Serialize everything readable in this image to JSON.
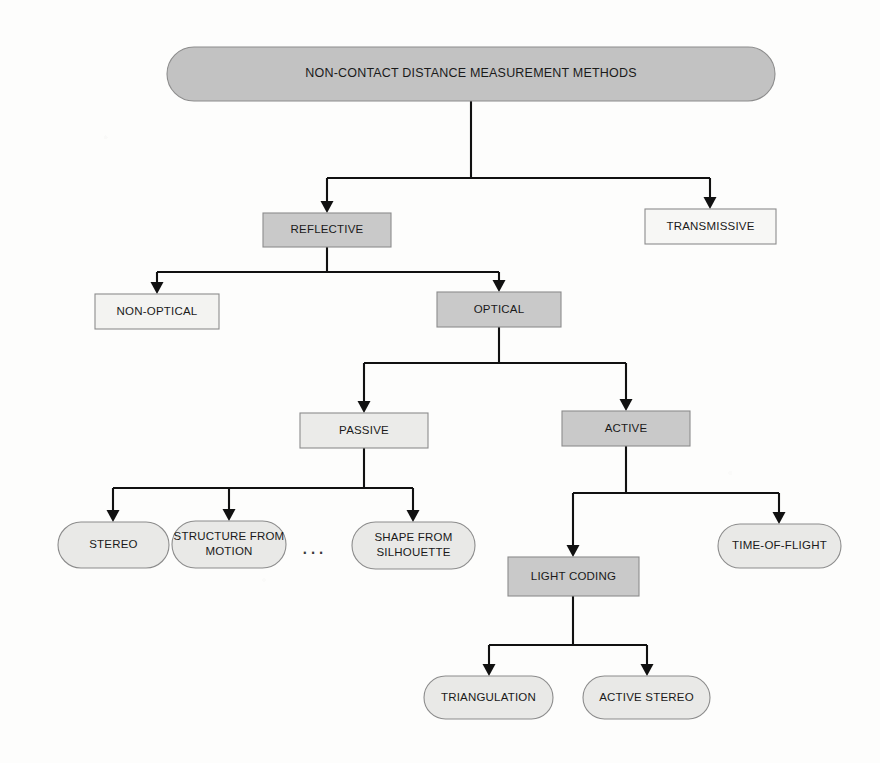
{
  "diagram": {
    "title": "NON-CONTACT DISTANCE MEASUREMENT METHODS",
    "type": "tree-taxonomy",
    "orientation": "top-down",
    "background_color": "#fdfdfc",
    "edge_color": "#111111",
    "palette": {
      "fill_dark": "#c9c9c9",
      "fill_light": "#ededed",
      "fill_white": "#f7f7f5",
      "stroke": "#8c8c8c",
      "text": "#1a1a1a"
    },
    "ellipsis": {
      "label": "...",
      "x": 314,
      "y": 548
    },
    "nodes": [
      {
        "id": "root",
        "label": "NON-CONTACT DISTANCE MEASUREMENT METHODS",
        "shape": "pill",
        "fill": "#c2c2c2",
        "stroke": "#8c8c8c",
        "x": 167,
        "y": 47,
        "w": 608,
        "h": 54,
        "font_size": 12.5,
        "lines": [
          "NON-CONTACT DISTANCE MEASUREMENT METHODS"
        ],
        "level": 0
      },
      {
        "id": "reflective",
        "label": "REFLECTIVE",
        "shape": "rect",
        "fill": "#c9c9c9",
        "stroke": "#8c8c8c",
        "x": 263,
        "y": 213,
        "w": 128,
        "h": 34,
        "font_size": 11.5,
        "lines": [
          "REFLECTIVE"
        ],
        "level": 1
      },
      {
        "id": "transmissive",
        "label": "TRANSMISSIVE",
        "shape": "rect",
        "fill": "#f7f7f5",
        "stroke": "#8c8c8c",
        "x": 645,
        "y": 209,
        "w": 131,
        "h": 35,
        "font_size": 11.5,
        "lines": [
          "TRANSMISSIVE"
        ],
        "level": 1
      },
      {
        "id": "non-optical",
        "label": "NON-OPTICAL",
        "shape": "rect",
        "fill": "#f3f3f1",
        "stroke": "#8c8c8c",
        "x": 95,
        "y": 294,
        "w": 124,
        "h": 35,
        "font_size": 11.5,
        "lines": [
          "NON-OPTICAL"
        ],
        "level": 2
      },
      {
        "id": "optical",
        "label": "OPTICAL",
        "shape": "rect",
        "fill": "#c9c9c9",
        "stroke": "#8c8c8c",
        "x": 437,
        "y": 292,
        "w": 124,
        "h": 35,
        "font_size": 11.5,
        "lines": [
          "OPTICAL"
        ],
        "level": 2
      },
      {
        "id": "passive",
        "label": "PASSIVE",
        "shape": "rect",
        "fill": "#ebebe9",
        "stroke": "#8c8c8c",
        "x": 300,
        "y": 413,
        "w": 128,
        "h": 35,
        "font_size": 11.5,
        "lines": [
          "PASSIVE"
        ],
        "level": 3
      },
      {
        "id": "active",
        "label": "ACTIVE",
        "shape": "rect",
        "fill": "#c9c9c9",
        "stroke": "#8c8c8c",
        "x": 562,
        "y": 411,
        "w": 128,
        "h": 35,
        "font_size": 11.5,
        "lines": [
          "ACTIVE"
        ],
        "level": 3
      },
      {
        "id": "stereo",
        "label": "STEREO",
        "shape": "pill",
        "fill": "#e9e9e7",
        "stroke": "#8c8c8c",
        "x": 58,
        "y": 522,
        "w": 111,
        "h": 46,
        "font_size": 11.5,
        "lines": [
          "STEREO"
        ],
        "level": 4
      },
      {
        "id": "structure-from-motion",
        "label": "STRUCTURE FROM MOTION",
        "shape": "pill",
        "fill": "#e9e9e7",
        "stroke": "#8c8c8c",
        "x": 172,
        "y": 521,
        "w": 114,
        "h": 47,
        "font_size": 11.5,
        "lines": [
          "STRUCTURE FROM",
          "MOTION"
        ],
        "level": 4
      },
      {
        "id": "shape-from-silhouette",
        "label": "SHAPE FROM SILHOUETTE",
        "shape": "pill",
        "fill": "#e9e9e7",
        "stroke": "#8c8c8c",
        "x": 352,
        "y": 522,
        "w": 123,
        "h": 47,
        "font_size": 11.5,
        "lines": [
          "SHAPE FROM",
          "SILHOUETTE"
        ],
        "level": 4
      },
      {
        "id": "light-coding",
        "label": "LIGHT CODING",
        "shape": "rect",
        "fill": "#c9c9c9",
        "stroke": "#8c8c8c",
        "x": 508,
        "y": 557,
        "w": 131,
        "h": 39,
        "font_size": 11.5,
        "lines": [
          "LIGHT CODING"
        ],
        "level": 4
      },
      {
        "id": "time-of-flight",
        "label": "TIME-OF-FLIGHT",
        "shape": "pill",
        "fill": "#e9e9e7",
        "stroke": "#8c8c8c",
        "x": 718,
        "y": 524,
        "w": 123,
        "h": 44,
        "font_size": 11.5,
        "lines": [
          "TIME-OF-FLIGHT"
        ],
        "level": 4
      },
      {
        "id": "triangulation",
        "label": "TRIANGULATION",
        "shape": "pill",
        "fill": "#e9e9e7",
        "stroke": "#8c8c8c",
        "x": 424,
        "y": 676,
        "w": 129,
        "h": 43,
        "font_size": 11.5,
        "lines": [
          "TRIANGULATION"
        ],
        "level": 5
      },
      {
        "id": "active-stereo",
        "label": "ACTIVE STEREO",
        "shape": "pill",
        "fill": "#e9e9e7",
        "stroke": "#8c8c8c",
        "x": 583,
        "y": 676,
        "w": 127,
        "h": 43,
        "font_size": 11.5,
        "lines": [
          "ACTIVE STEREO"
        ],
        "level": 5
      }
    ],
    "edges": [
      {
        "id": "root-reflective",
        "from": "root",
        "to": "reflective",
        "path": "M471,101 L471,178 M327,178 L710,178 M327,178 L327,205",
        "arrow_x": 327,
        "arrow_y": 213
      },
      {
        "id": "root-transmissive",
        "from": "root",
        "to": "transmissive",
        "path": "M710,178 L710,201",
        "arrow_x": 710,
        "arrow_y": 209
      },
      {
        "id": "reflective-nonoptical",
        "from": "reflective",
        "to": "non-optical",
        "path": "M327,247 L327,272 M157,272 L499,272 M157,272 L157,286",
        "arrow_x": 157,
        "arrow_y": 294
      },
      {
        "id": "reflective-optical",
        "from": "reflective",
        "to": "optical",
        "path": "M499,272 L499,284",
        "arrow_x": 499,
        "arrow_y": 292
      },
      {
        "id": "optical-passive",
        "from": "optical",
        "to": "passive",
        "path": "M499,327 L499,363 M364,363 L626,363 M364,363 L364,405",
        "arrow_x": 364,
        "arrow_y": 413
      },
      {
        "id": "optical-active",
        "from": "optical",
        "to": "active",
        "path": "M626,363 L626,403",
        "arrow_x": 626,
        "arrow_y": 411
      },
      {
        "id": "passive-stereo",
        "from": "passive",
        "to": "stereo",
        "path": "M364,448 L364,488 M113,488 L413,488 M113,488 L113,514",
        "arrow_x": 113,
        "arrow_y": 522
      },
      {
        "id": "passive-sfm",
        "from": "passive",
        "to": "structure-from-motion",
        "path": "M229,488 L229,513",
        "arrow_x": 229,
        "arrow_y": 521
      },
      {
        "id": "passive-shape-silhouette",
        "from": "passive",
        "to": "shape-from-silhouette",
        "path": "M413,488 L413,514",
        "arrow_x": 413,
        "arrow_y": 522
      },
      {
        "id": "active-lightcoding",
        "from": "active",
        "to": "light-coding",
        "path": "M626,446 L626,493 M573,493 L779,493 M573,493 L573,549",
        "arrow_x": 573,
        "arrow_y": 557
      },
      {
        "id": "active-tof",
        "from": "active",
        "to": "time-of-flight",
        "path": "M779,493 L779,516",
        "arrow_x": 779,
        "arrow_y": 524
      },
      {
        "id": "lightcoding-triangulation",
        "from": "light-coding",
        "to": "triangulation",
        "path": "M573,596 L573,645 M489,645 L647,645 M489,645 L489,668",
        "arrow_x": 489,
        "arrow_y": 676
      },
      {
        "id": "lightcoding-activestereo",
        "from": "light-coding",
        "to": "active-stereo",
        "path": "M647,645 L647,668",
        "arrow_x": 647,
        "arrow_y": 676
      }
    ]
  }
}
